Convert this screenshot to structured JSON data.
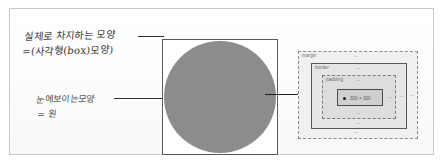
{
  "figure": {
    "type": "annotated-diagram",
    "background_color": "#ffffff",
    "frame_border_color": "#c9c9c9"
  },
  "notes": {
    "box_shape": {
      "line1": "실제로 차지하는 모양",
      "line2": "=(사각형(box)모양)"
    },
    "visible_shape": {
      "line1": "눈에보이는모양",
      "line2": "= 원"
    }
  },
  "shape": {
    "square_label": "square",
    "circle_label": "circle",
    "circle_color": "#8c8c8c",
    "square_border_color": "#5a5a5a",
    "square_fill": "#ffffff"
  },
  "box_model": {
    "layers": [
      {
        "name": "margin",
        "label": "margin",
        "fill": "#f0f0f0",
        "stroke": "#8d8d8d",
        "stroke_style": "dashed"
      },
      {
        "name": "border",
        "label": "border",
        "fill": "#e6e6e6",
        "stroke": "#585858",
        "stroke_style": "solid"
      },
      {
        "name": "padding",
        "label": "padding",
        "fill": "#dddddd",
        "stroke": "#7d7d7d",
        "stroke_style": "dashed"
      },
      {
        "name": "content",
        "label": "",
        "fill": "#cfcfcf",
        "stroke": "#4a4a4a",
        "stroke_style": "solid"
      }
    ],
    "content_size": "300 × 300",
    "tick_glyph": "–"
  },
  "connectors": {
    "leader_top": "",
    "leader_mid": "",
    "circle_to_boxmodel": ""
  }
}
